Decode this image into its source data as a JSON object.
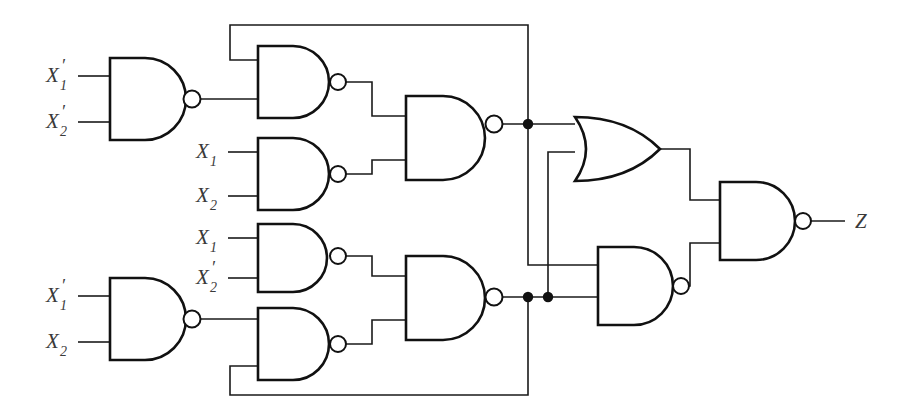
{
  "diagram": {
    "type": "logic-circuit-schematic",
    "background_color": "#ffffff",
    "line_color": "#1a1a1a",
    "label_color": "#3a3a3a"
  },
  "labels": {
    "g1_in1": {
      "base": "X",
      "sub": "1",
      "prime": "′"
    },
    "g1_in2": {
      "base": "X",
      "sub": "2",
      "prime": "′"
    },
    "g3_in1": {
      "base": "X",
      "sub": "1",
      "prime": ""
    },
    "g3_in2": {
      "base": "X",
      "sub": "2",
      "prime": ""
    },
    "g4_in1": {
      "base": "X",
      "sub": "1",
      "prime": ""
    },
    "g4_in2": {
      "base": "X",
      "sub": "2",
      "prime": "′"
    },
    "g6_in1": {
      "base": "X",
      "sub": "1",
      "prime": "′"
    },
    "g6_in2": {
      "base": "X",
      "sub": "2",
      "prime": ""
    },
    "output": {
      "base": "Z",
      "sub": "",
      "prime": ""
    }
  },
  "gates": [
    {
      "id": "g1",
      "type": "NAND",
      "name": "nand-gate-top-left",
      "inputs": [
        "X1'",
        "X2'"
      ],
      "x": 110,
      "y": 58,
      "w": 70,
      "h": 82
    },
    {
      "id": "g2",
      "type": "NAND",
      "name": "nand-gate-upper-feedback",
      "inputs": [
        "feedback-top",
        "g1-out"
      ],
      "x": 258,
      "y": 46,
      "w": 70,
      "h": 72
    },
    {
      "id": "g3",
      "type": "NAND",
      "name": "nand-gate-x1-x2",
      "inputs": [
        "X1",
        "X2"
      ],
      "x": 258,
      "y": 138,
      "w": 70,
      "h": 72
    },
    {
      "id": "g4",
      "type": "NAND",
      "name": "nand-gate-x1-x2prime",
      "inputs": [
        "X1",
        "X2'"
      ],
      "x": 258,
      "y": 224,
      "w": 70,
      "h": 68
    },
    {
      "id": "g5",
      "type": "NAND",
      "name": "nand-gate-merge-upper",
      "inputs": [
        "g2-out",
        "g3-out"
      ],
      "x": 406,
      "y": 96,
      "w": 78,
      "h": 84
    },
    {
      "id": "g6",
      "type": "NAND",
      "name": "nand-gate-bottom-left",
      "inputs": [
        "X1'",
        "X2"
      ],
      "x": 110,
      "y": 278,
      "w": 70,
      "h": 82
    },
    {
      "id": "g7",
      "type": "NAND",
      "name": "nand-gate-lower-feedback",
      "inputs": [
        "g6-out",
        "feedback-bottom"
      ],
      "x": 258,
      "y": 308,
      "w": 70,
      "h": 72
    },
    {
      "id": "g8",
      "type": "NAND",
      "name": "nand-gate-merge-lower",
      "inputs": [
        "g4-out",
        "g7-out"
      ],
      "x": 406,
      "y": 256,
      "w": 78,
      "h": 84
    },
    {
      "id": "g9",
      "type": "OR",
      "name": "or-gate",
      "inputs": [
        "node-upper",
        "node-lower"
      ],
      "x": 575,
      "y": 117,
      "w": 85,
      "h": 64
    },
    {
      "id": "g10",
      "type": "NAND",
      "name": "nand-gate-lower-right",
      "inputs": [
        "node-upper",
        "node-lower"
      ],
      "x": 598,
      "y": 247,
      "w": 72,
      "h": 78
    },
    {
      "id": "g11",
      "type": "NAND",
      "name": "nand-gate-output",
      "inputs": [
        "or-out",
        "g10-out"
      ],
      "x": 720,
      "y": 182,
      "w": 72,
      "h": 78
    }
  ],
  "nodes": [
    {
      "name": "junction-upper",
      "x": 528,
      "y": 124
    },
    {
      "name": "junction-lower-left",
      "x": 528,
      "y": 297
    },
    {
      "name": "junction-lower-right",
      "x": 548,
      "y": 297
    }
  ],
  "connections": {
    "feedback_top": "junction-upper routes up to y=25, left to x=230, down into g2 upper input",
    "feedback_bottom": "junction-lower-left routes down to y=395, left to x=230, up into g7 lower input",
    "cross_upper_to_lower_nand": "junction-upper down to y=265 then right into g10 upper input",
    "cross_lower_to_or": "junction-lower-right up to y=152 then right into g9 lower input"
  }
}
